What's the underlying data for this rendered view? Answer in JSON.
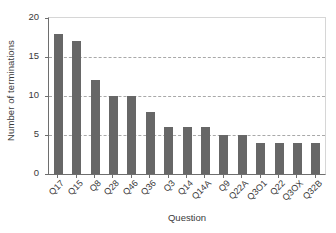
{
  "chart_data": {
    "type": "bar",
    "title": "",
    "xlabel": "Question",
    "ylabel": "Number of terminations",
    "categories": [
      "Q17",
      "Q15",
      "Q8",
      "Q28",
      "Q46",
      "Q36",
      "Q3",
      "Q14",
      "Q14A",
      "Q9",
      "Q22A",
      "Q3O1",
      "Q22",
      "Q3OX",
      "Q32B"
    ],
    "values": [
      18,
      17,
      12,
      10,
      10,
      8,
      6,
      6,
      6,
      5,
      5,
      4,
      4,
      4,
      4
    ],
    "ylim": [
      0,
      20
    ],
    "yticks": [
      0,
      5,
      10,
      15,
      20
    ],
    "ytick_labels": [
      "0",
      "5",
      "10",
      "15",
      "20"
    ],
    "gridlines": [
      5,
      10,
      15
    ],
    "grid": "horizontal-dashed",
    "legend": "none",
    "bar_color": "#676767",
    "grid_color": "#a9a9a9",
    "axis_color": "#6e6e6e",
    "frame_color": "#d6d6d6",
    "text_color": "#3a3a3a"
  }
}
